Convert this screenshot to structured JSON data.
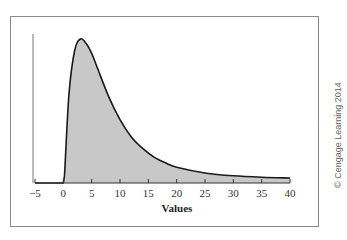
{
  "chart_data": {
    "type": "area",
    "title": "",
    "xlabel": "Values",
    "ylabel": "",
    "xlim": [
      -5,
      40
    ],
    "x_ticks": [
      -5,
      0,
      5,
      10,
      15,
      20,
      25,
      30,
      35,
      40
    ],
    "y_ticks": [],
    "grid": false,
    "legend": null,
    "series": [
      {
        "name": "density (relative, peak = 1)",
        "x": [
          -5,
          0,
          0.2,
          1,
          2,
          3,
          4,
          5,
          6,
          8,
          10,
          12,
          14,
          16,
          18,
          20,
          25,
          30,
          35,
          40
        ],
        "y": [
          0,
          0,
          0.05,
          0.62,
          0.92,
          1.0,
          0.97,
          0.9,
          0.8,
          0.6,
          0.44,
          0.32,
          0.24,
          0.18,
          0.14,
          0.11,
          0.07,
          0.05,
          0.04,
          0.035
        ]
      }
    ],
    "colors": {
      "fill": "#c8c8c8",
      "line": "#1a1a1a"
    }
  },
  "axis": {
    "x_label": "Values"
  },
  "credit": "© Cengage Learning 2014"
}
